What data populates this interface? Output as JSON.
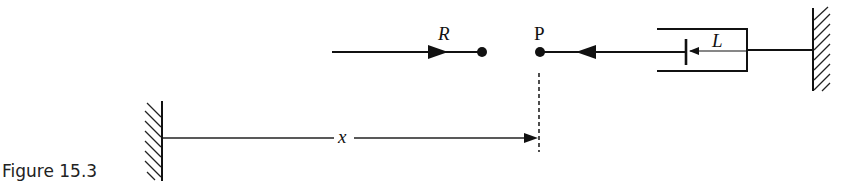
{
  "figure": {
    "caption": "Figure 15.3",
    "labels": {
      "R": "R",
      "P": "P",
      "L": "L",
      "x": "x"
    }
  },
  "elements": {
    "left_wall": {
      "type": "hatched-wall",
      "x": 162,
      "y_top": 102,
      "y_bottom": 180,
      "hatch_side": "left"
    },
    "right_wall": {
      "type": "hatched-wall",
      "x": 813,
      "y_top": 8,
      "y_bottom": 91,
      "hatch_side": "right"
    },
    "R_rod": {
      "from_x": 332,
      "to_x": 481,
      "y": 52,
      "arrow_direction": "right",
      "end_dot": true
    },
    "P_point": {
      "x": 539,
      "y": 52
    },
    "L_rod": {
      "from_x": 539,
      "to_x": 686,
      "y": 52,
      "arrow_direction": "left"
    },
    "cylinder": {
      "left_x": 657,
      "right_x": 747,
      "top_y": 29,
      "bottom_y": 71
    },
    "piston": {
      "x": 686,
      "top_y": 39,
      "bottom_y": 65
    },
    "x_dimension": {
      "from_x": 162,
      "to_x": 538,
      "y": 138
    },
    "P_dashed_line": {
      "x": 539,
      "y_top": 73,
      "y_bottom": 152
    }
  },
  "colors": {
    "stroke": "#111111",
    "background": "#ffffff"
  }
}
